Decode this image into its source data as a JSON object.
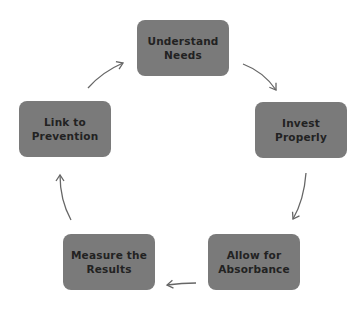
{
  "diagram": {
    "type": "cycle",
    "colors": {
      "node_fill": "#7a7a7a",
      "node_text": "#222222",
      "arrow": "#666666",
      "background": "#ffffff"
    },
    "nodes": [
      {
        "id": "understand-needs",
        "line1": "Understand",
        "line2": "Needs"
      },
      {
        "id": "invest-properly",
        "line1": "Invest",
        "line2": "Properly"
      },
      {
        "id": "allow-for-absorbance",
        "line1": "Allow for",
        "line2": "Absorbance"
      },
      {
        "id": "measure-the-results",
        "line1": "Measure the",
        "line2": "Results"
      },
      {
        "id": "link-to-prevention",
        "line1": "Link to",
        "line2": "Prevention"
      }
    ],
    "edges": [
      {
        "from": "understand-needs",
        "to": "invest-properly"
      },
      {
        "from": "invest-properly",
        "to": "allow-for-absorbance"
      },
      {
        "from": "allow-for-absorbance",
        "to": "measure-the-results"
      },
      {
        "from": "measure-the-results",
        "to": "link-to-prevention"
      },
      {
        "from": "link-to-prevention",
        "to": "understand-needs"
      }
    ]
  }
}
